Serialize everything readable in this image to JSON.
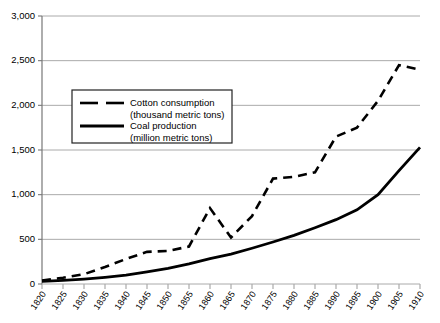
{
  "chart_data": {
    "type": "line",
    "title": "",
    "subtitle": "",
    "xlabel": "",
    "ylabel": "",
    "xlim": [
      1820,
      1910
    ],
    "ylim": [
      0,
      3000
    ],
    "grid": true,
    "legend_position": "upper-left-inside",
    "x": [
      1820,
      1825,
      1830,
      1835,
      1840,
      1845,
      1850,
      1855,
      1860,
      1865,
      1870,
      1875,
      1880,
      1885,
      1890,
      1895,
      1900,
      1905,
      1910
    ],
    "xtick_labels": [
      "1820",
      "1825",
      "1830",
      "1835",
      "1840",
      "1845",
      "1850",
      "1855",
      "1860",
      "1865",
      "1870",
      "1875",
      "1880",
      "1885",
      "1890",
      "1895",
      "1900",
      "1905",
      "1910"
    ],
    "ytick_labels": [
      "0",
      "500",
      "1,000",
      "1,500",
      "2,000",
      "2,500",
      "3,000"
    ],
    "ytick_values": [
      0,
      500,
      1000,
      1500,
      2000,
      2500,
      3000
    ],
    "series": [
      {
        "name": "Cotton consumption",
        "unit": "(thousand metric tons)",
        "style": "dashed",
        "color": "#000000",
        "values": [
          40,
          70,
          110,
          190,
          280,
          360,
          370,
          420,
          850,
          520,
          760,
          1180,
          1200,
          1250,
          1650,
          1750,
          2050,
          2450,
          2400
        ]
      },
      {
        "name": "Coal production",
        "unit": "(million metric tons)",
        "style": "solid",
        "color": "#000000",
        "values": [
          30,
          40,
          55,
          75,
          100,
          135,
          175,
          225,
          285,
          335,
          400,
          470,
          545,
          630,
          720,
          830,
          1000,
          1270,
          1530
        ]
      }
    ]
  },
  "legend": {
    "entries": [
      {
        "label": "Cotton consumption",
        "sub": "(thousand metric tons)"
      },
      {
        "label": "Coal production",
        "sub": "(million metric tons)"
      }
    ]
  },
  "colors": {
    "axis": "#555555",
    "grid": "#aaaaaa",
    "line": "#000000",
    "background": "#ffffff",
    "legend_border": "#222222"
  }
}
